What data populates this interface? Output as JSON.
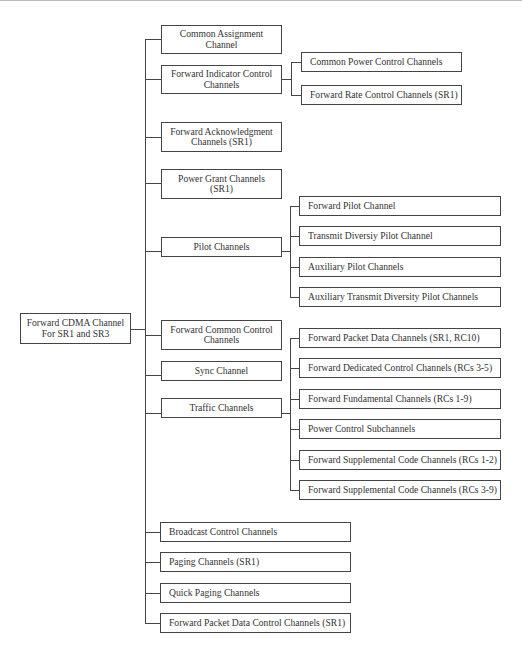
{
  "diagram": {
    "title": "Forward CDMA Channel For SR1 and SR3",
    "root": {
      "label": "Forward CDMA Channel\nFor SR1 and SR3"
    },
    "level1": [
      {
        "id": "common-assignment",
        "label": "Common Assignment\nChannel"
      },
      {
        "id": "forward-indicator-control",
        "label": "Forward Indicator Control\nChannels"
      },
      {
        "id": "forward-acknowledgment",
        "label": "Forward Acknowledgment\nChannels (SR1)"
      },
      {
        "id": "power-grant",
        "label": "Power Grant Channels\n(SR1)"
      },
      {
        "id": "pilot",
        "label": "Pilot Channels"
      },
      {
        "id": "forward-common-control",
        "label": "Forward Common Control\nChannels"
      },
      {
        "id": "sync",
        "label": "Sync Channel"
      },
      {
        "id": "traffic",
        "label": "Traffic Channels"
      },
      {
        "id": "broadcast-control",
        "label": "Broadcast Control Channels"
      },
      {
        "id": "paging",
        "label": "Paging Channels (SR1)"
      },
      {
        "id": "quick-paging",
        "label": "Quick Paging Channels"
      },
      {
        "id": "forward-packet-data-control",
        "label": "Forward Packet Data Control Channels  (SR1)"
      }
    ],
    "indicator_children": [
      {
        "label": "Common Power Control Channels"
      },
      {
        "label": "Forward Rate Control Channels (SR1)"
      }
    ],
    "pilot_children": [
      {
        "label": "Forward Pilot Channel"
      },
      {
        "label": "Transmit Diversiy Pilot Channel"
      },
      {
        "label": "Auxiliary Pilot Channels"
      },
      {
        "label": "Auxiliary Transmit Diversity Pilot Channels"
      }
    ],
    "traffic_children": [
      {
        "label": "Forward Packet Data Channels (SR1, RC10)"
      },
      {
        "label": "Forward Dedicated Control Channels (RCs 3-5)"
      },
      {
        "label": "Forward Fundamental Channels (RCs 1-9)"
      },
      {
        "label": "Power Control Subchannels"
      },
      {
        "label": "Forward Supplemental Code Channels (RCs 1-2)"
      },
      {
        "label": "Forward Supplemental Code Channels (RCs 3-9)"
      }
    ]
  }
}
